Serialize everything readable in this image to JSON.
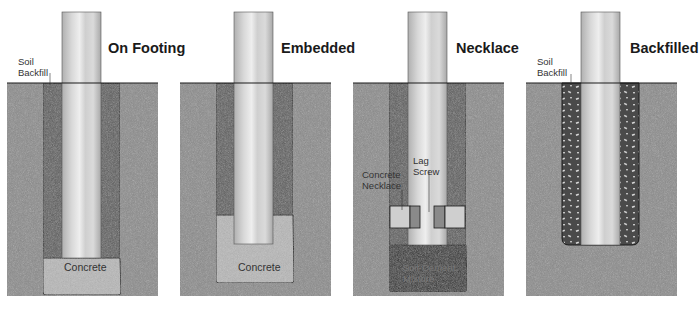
{
  "diagram": {
    "panels": [
      {
        "id": "on-footing",
        "title": "On Footing",
        "labels": {
          "soil_backfill": "Soil\nBackfill",
          "soil_line1": "Soil",
          "soil_line2": "Backfill",
          "footing": "Concrete"
        }
      },
      {
        "id": "embedded",
        "title": "Embedded",
        "labels": {
          "footing": "Concrete"
        }
      },
      {
        "id": "necklace",
        "title": "Necklace",
        "labels": {
          "lag_line1": "Lag",
          "lag_line2": "Screw",
          "neck_line1": "Concrete",
          "neck_line2": "Necklace",
          "mix_line1": "Soil-Cement",
          "mix_line2": "Mixture"
        }
      },
      {
        "id": "backfilled",
        "title": "Backfilled",
        "labels": {
          "soil_line1": "Soil",
          "soil_line2": "Backfill"
        }
      }
    ],
    "colors": {
      "ground": "#8c8c8c",
      "backfill": "#5e5e5e",
      "concrete": "#b4b4b4",
      "soil_cement": "#3a3a3a",
      "gravel_bg": "#4a4a4a",
      "post": "#c8c8c8",
      "outline": "#1a1a1a"
    }
  }
}
